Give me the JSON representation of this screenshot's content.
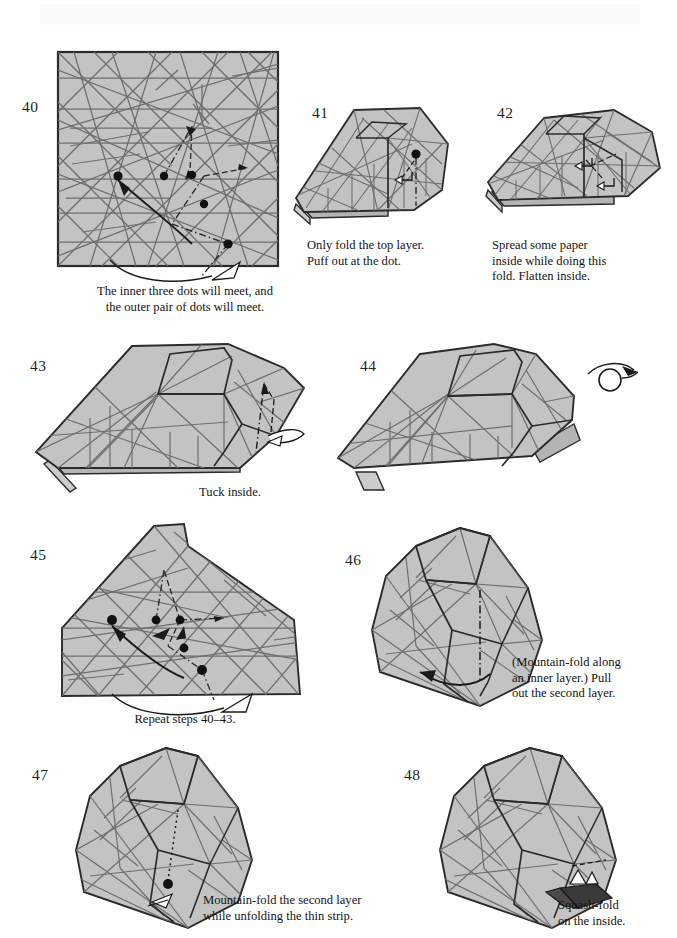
{
  "page": {
    "width": 677,
    "height": 938,
    "background": "#ffffff",
    "kind": "origami-instruction-page"
  },
  "colors": {
    "paper_fill": "#c3c3c3",
    "paper_fill_shade": "#b4b4b4",
    "paper_fill_light": "#cccccc",
    "outline": "#2b2b2b",
    "crease": "#6e6e6e",
    "crease_strong": "#4a4a4a",
    "dot": "#111111",
    "text": "#141414",
    "arrow_fill_solid": "#3a3a3a"
  },
  "steps": [
    {
      "number": "40",
      "number_pos": {
        "x": 22,
        "y": 98
      },
      "shape": "square-crease-pattern",
      "caption": "The inner three dots will meet, and\nthe outer pair of dots will meet.",
      "caption_pos": {
        "x": 60,
        "y": 284
      },
      "caption_width": 250,
      "align": "center",
      "markers": [
        "five-dots",
        "valley-arrow",
        "curved-pull-arrow",
        "hollow-arrowhead"
      ]
    },
    {
      "number": "41",
      "number_pos": {
        "x": 312,
        "y": 104
      },
      "shape": "folded-wedge",
      "caption": "Only fold the top layer.\nPuff out at the dot.",
      "caption_pos": {
        "x": 307,
        "y": 238
      },
      "caption_width": 170,
      "align": "left",
      "markers": [
        "single-dot",
        "dash-dot-fold-line",
        "small-hollow-arrow"
      ]
    },
    {
      "number": "42",
      "number_pos": {
        "x": 497,
        "y": 104
      },
      "shape": "folded-wedge-spread",
      "caption": "Spread some paper\ninside while doing this\nfold. Flatten inside.",
      "caption_pos": {
        "x": 492,
        "y": 238
      },
      "caption_width": 175,
      "align": "left",
      "markers": [
        "dashed-fold-line",
        "two-hollow-arrows"
      ]
    },
    {
      "number": "43",
      "number_pos": {
        "x": 30,
        "y": 357
      },
      "shape": "head-profile-left",
      "caption": "Tuck inside.",
      "caption_pos": {
        "x": 170,
        "y": 487
      },
      "caption_width": 120,
      "align": "center",
      "markers": [
        "dash-dot-fold-line",
        "tuck-hollow-arrow"
      ]
    },
    {
      "number": "44",
      "number_pos": {
        "x": 360,
        "y": 357
      },
      "shape": "head-profile-left-folded",
      "caption": "",
      "caption_pos": {
        "x": 0,
        "y": 0
      },
      "caption_width": 0,
      "align": "left",
      "markers": [
        "turn-over-arrow"
      ]
    },
    {
      "number": "45",
      "number_pos": {
        "x": 30,
        "y": 546
      },
      "shape": "wide-crease-pattern",
      "caption": "Repeat steps 40–43.",
      "caption_pos": {
        "x": 60,
        "y": 712
      },
      "caption_width": 250,
      "align": "center",
      "markers": [
        "five-dots",
        "valley-arrow",
        "curved-pull-arrow",
        "hollow-arrowhead"
      ]
    },
    {
      "number": "46",
      "number_pos": {
        "x": 345,
        "y": 551
      },
      "shape": "head-three-quarter",
      "caption": "(Mountain-fold along\nan inner layer.) Pull\nout the second layer.",
      "caption_pos": {
        "x": 512,
        "y": 657
      },
      "caption_width": 160,
      "align": "left",
      "markers": [
        "dash-dot-mountain-line",
        "pull-out-arrow"
      ]
    },
    {
      "number": "47",
      "number_pos": {
        "x": 32,
        "y": 766
      },
      "shape": "head-three-quarter-tucked",
      "caption": "Mountain-fold the second layer\nwhile unfolding the thin strip.",
      "caption_pos": {
        "x": 203,
        "y": 895
      },
      "caption_width": 240,
      "align": "left",
      "markers": [
        "single-dot",
        "dotted-fold-line",
        "small-hollow-arrow"
      ]
    },
    {
      "number": "48",
      "number_pos": {
        "x": 404,
        "y": 766
      },
      "shape": "head-three-quarter-final",
      "caption": "Squash-fold\non the inside.",
      "caption_pos": {
        "x": 558,
        "y": 900
      },
      "caption_width": 120,
      "align": "left",
      "markers": [
        "solid-black-arrow",
        "small-triangle-marker"
      ]
    }
  ]
}
